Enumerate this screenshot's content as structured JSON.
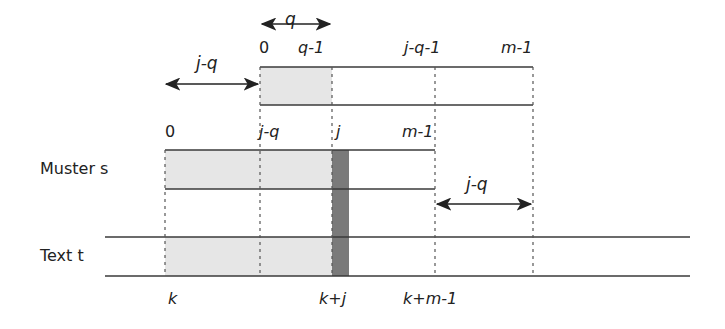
{
  "diagram": {
    "type": "string-matching-shift-diagram",
    "colors": {
      "line": "#3a3a3a",
      "dash": "#555555",
      "shade_light": "#e6e6e6",
      "shade_dark": "#7a7a7a"
    },
    "rows": {
      "pattern_label": "Muster s",
      "text_label": "Text t"
    },
    "shifted_pattern": {
      "index_labels": [
        "0",
        "q-1",
        "j-q-1",
        "m-1"
      ],
      "q_arrow_label": "q",
      "shift_arrow_label": "j-q"
    },
    "pattern": {
      "index_labels": [
        "0",
        "j-q",
        "j",
        "m-1"
      ],
      "right_arrow_label": "j-q"
    },
    "text": {
      "index_labels": [
        "k",
        "k+j",
        "k+m-1"
      ]
    }
  }
}
